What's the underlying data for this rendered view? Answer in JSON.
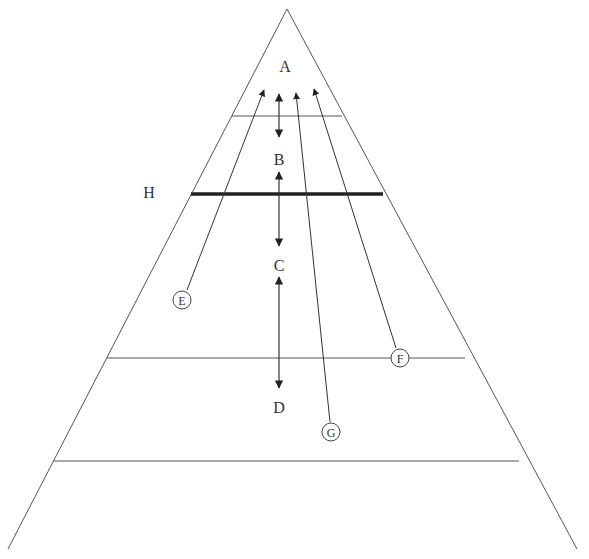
{
  "diagram": {
    "type": "pyramid",
    "levels": [
      {
        "id": "A",
        "label": "A"
      },
      {
        "id": "B",
        "label": "B"
      },
      {
        "id": "C",
        "label": "C"
      },
      {
        "id": "D",
        "label": "D"
      }
    ],
    "boundary_label": "H",
    "pathways": [
      {
        "id": "E",
        "label": "E"
      },
      {
        "id": "F",
        "label": "F"
      },
      {
        "id": "G",
        "label": "G"
      }
    ],
    "colors": {
      "line": "#333333",
      "background": "#ffffff"
    }
  }
}
